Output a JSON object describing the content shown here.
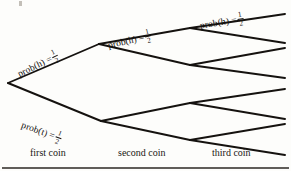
{
  "figure": {
    "background_color": "#fdfdfb",
    "ink_color": "#15120f"
  },
  "branch_labels": [
    {
      "id": "first-heads",
      "text": "prob(h) =",
      "numerator": "1",
      "denominator": "2",
      "x": 18,
      "y": 66,
      "rotation": -26
    },
    {
      "id": "first-tails",
      "text": "prob(t) =",
      "numerator": "1",
      "denominator": "2",
      "x": 22,
      "y": 116,
      "rotation": 20
    },
    {
      "id": "second-heads",
      "text": "prob(h) =",
      "numerator": "1",
      "denominator": "2",
      "x": 108,
      "y": 37,
      "rotation": -13
    },
    {
      "id": "third-heads",
      "text": "prob(h) =",
      "numerator": "1",
      "denominator": "2",
      "x": 200,
      "y": 17,
      "rotation": -9
    }
  ],
  "axis": {
    "stages": [
      {
        "id": "first",
        "label": "first coin"
      },
      {
        "id": "second",
        "label": "second coin"
      },
      {
        "id": "third",
        "label": "third coin"
      }
    ],
    "rule_y": 168
  },
  "chart_data": {
    "type": "diagram",
    "diagram_kind": "probability-tree",
    "probability_per_branch": 0.5,
    "stages": [
      "first coin",
      "second coin",
      "third coin"
    ],
    "nodes": [
      {
        "id": "root",
        "x": 8,
        "y": 83,
        "level": 0
      },
      {
        "id": "h",
        "x": 99,
        "y": 44,
        "level": 1
      },
      {
        "id": "t",
        "x": 101,
        "y": 121,
        "level": 1
      },
      {
        "id": "hh",
        "x": 190,
        "y": 28,
        "level": 2
      },
      {
        "id": "ht",
        "x": 190,
        "y": 65,
        "level": 2
      },
      {
        "id": "th",
        "x": 190,
        "y": 103,
        "level": 2
      },
      {
        "id": "tt",
        "x": 190,
        "y": 140,
        "level": 2
      },
      {
        "id": "hhh",
        "x": 285,
        "y": 14,
        "level": 3
      },
      {
        "id": "hht",
        "x": 285,
        "y": 43,
        "level": 3
      },
      {
        "id": "hth",
        "x": 285,
        "y": 48,
        "level": 3
      },
      {
        "id": "htt",
        "x": 285,
        "y": 78,
        "level": 3
      },
      {
        "id": "tth",
        "x": 285,
        "y": 89,
        "level": 3
      },
      {
        "id": "ttt",
        "x": 285,
        "y": 119,
        "level": 3
      },
      {
        "id": "thh",
        "x": 285,
        "y": 124,
        "level": 3
      },
      {
        "id": "tht",
        "x": 285,
        "y": 155,
        "level": 3
      }
    ],
    "edges": [
      {
        "from": "root",
        "to": "h",
        "outcome": "h",
        "probability": 0.5,
        "label": "prob(h) = 1/2"
      },
      {
        "from": "root",
        "to": "t",
        "outcome": "t",
        "probability": 0.5,
        "label": "prob(t) = 1/2"
      },
      {
        "from": "h",
        "to": "hh",
        "outcome": "h",
        "probability": 0.5,
        "label": "prob(h) = 1/2"
      },
      {
        "from": "h",
        "to": "ht",
        "outcome": "t",
        "probability": 0.5,
        "label": ""
      },
      {
        "from": "t",
        "to": "th",
        "outcome": "h",
        "probability": 0.5,
        "label": ""
      },
      {
        "from": "t",
        "to": "tt",
        "outcome": "t",
        "probability": 0.5,
        "label": ""
      },
      {
        "from": "hh",
        "to": "hhh",
        "outcome": "h",
        "probability": 0.5,
        "label": "prob(h) = 1/2"
      },
      {
        "from": "hh",
        "to": "hht",
        "outcome": "t",
        "probability": 0.5,
        "label": ""
      },
      {
        "from": "ht",
        "to": "hth",
        "outcome": "h",
        "probability": 0.5,
        "label": ""
      },
      {
        "from": "ht",
        "to": "htt",
        "outcome": "t",
        "probability": 0.5,
        "label": ""
      },
      {
        "from": "th",
        "to": "tth",
        "outcome": "h",
        "probability": 0.5,
        "label": ""
      },
      {
        "from": "th",
        "to": "ttt",
        "outcome": "t",
        "probability": 0.5,
        "label": ""
      },
      {
        "from": "tt",
        "to": "thh",
        "outcome": "h",
        "probability": 0.5,
        "label": ""
      },
      {
        "from": "tt",
        "to": "tht",
        "outcome": "t",
        "probability": 0.5,
        "label": ""
      }
    ],
    "xlabel": "",
    "ylabel": "",
    "legend": []
  }
}
